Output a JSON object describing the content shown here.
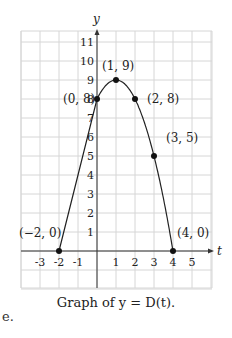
{
  "chart_data": {
    "type": "line",
    "title": "Graph of y = D(t).",
    "xlabel": "t",
    "ylabel": "y",
    "xlim": [
      -4,
      6
    ],
    "ylim": [
      -2,
      11.6
    ],
    "grid": true,
    "x_ticks": [
      -3,
      -2,
      -1,
      1,
      2,
      3,
      4,
      5
    ],
    "y_ticks": [
      1,
      2,
      3,
      4,
      5,
      6,
      7,
      8,
      9,
      10,
      11
    ],
    "series": [
      {
        "name": "D(t)",
        "x": [
          -2,
          0,
          1,
          2,
          3,
          4
        ],
        "y": [
          0,
          8,
          9,
          8,
          5,
          0
        ]
      }
    ],
    "annotations": [
      {
        "text": "(−2, 0)",
        "x": -2,
        "y": 0
      },
      {
        "text": "(0, 8)",
        "x": 0,
        "y": 8
      },
      {
        "text": "(1, 9)",
        "x": 1,
        "y": 9
      },
      {
        "text": "(2, 8)",
        "x": 2,
        "y": 8
      },
      {
        "text": "(3, 5)",
        "x": 3,
        "y": 5
      },
      {
        "text": "(4, 0)",
        "x": 4,
        "y": 0
      }
    ]
  },
  "caption": "Graph of y = D(t).",
  "side_letter": "e."
}
